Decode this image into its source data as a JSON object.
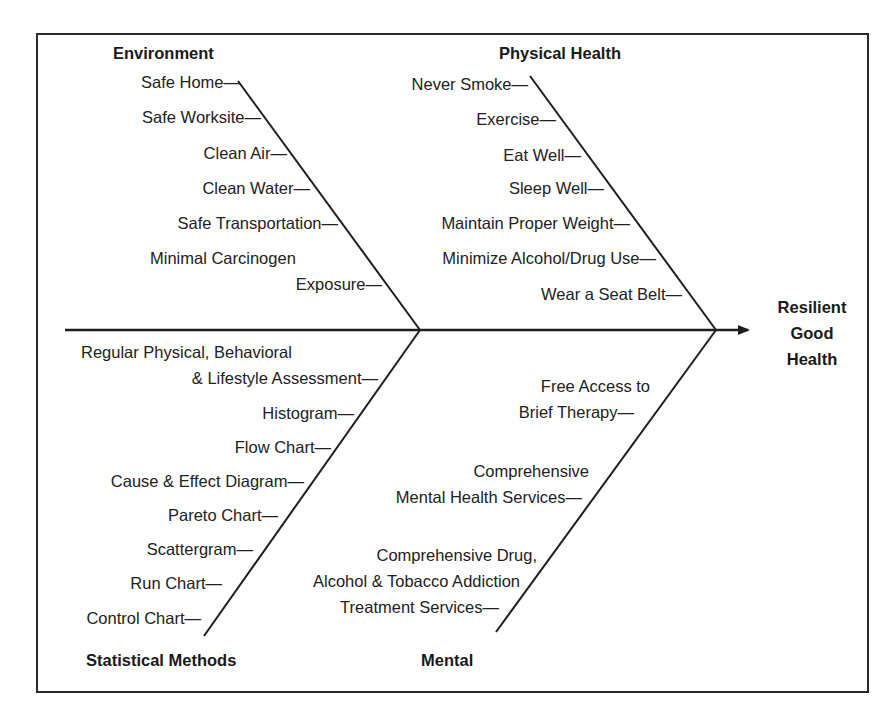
{
  "diagram": {
    "type": "fishbone",
    "effect": [
      "Resilient",
      "Good",
      "Health"
    ],
    "categories": {
      "environment": {
        "title": "Environment",
        "causes": [
          "Safe Home—",
          "Safe Worksite—",
          "Clean Air—",
          "Clean Water—",
          "Safe Transportation—",
          "Minimal Carcinogen",
          "Exposure—"
        ]
      },
      "physical_health": {
        "title": "Physical Health",
        "causes": [
          "Never Smoke—",
          "Exercise—",
          "Eat Well—",
          "Sleep Well—",
          "Maintain Proper Weight—",
          "Minimize Alcohol/Drug Use—",
          "Wear a Seat Belt—"
        ]
      },
      "statistical_methods": {
        "title": "Statistical Methods",
        "causes": [
          "Regular Physical, Behavioral",
          "& Lifestyle Assessment—",
          "Histogram—",
          "Flow Chart—",
          "Cause & Effect Diagram—",
          "Pareto Chart—",
          "Scattergram—",
          "Run Chart—",
          "Control Chart—"
        ]
      },
      "mental": {
        "title": "Mental",
        "causes": [
          "Free Access to",
          "Brief Therapy—",
          "Comprehensive",
          "Mental Health Services—",
          "Comprehensive Drug,",
          "Alcohol & Tobacco Addiction",
          "Treatment Services—"
        ]
      }
    },
    "colors": {
      "line": "#1e1e1e",
      "text": "#222222",
      "background": "#ffffff"
    }
  }
}
